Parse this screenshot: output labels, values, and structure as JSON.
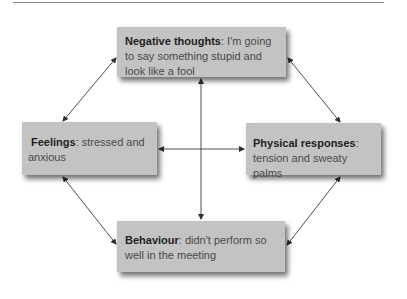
{
  "diagram": {
    "type": "cycle-diagram",
    "nodes": {
      "negative_thoughts": {
        "label": "Negative thoughts",
        "separator": ":",
        "text": " I'm going to say something stupid and look like a fool",
        "position": "top"
      },
      "feelings": {
        "label": "Feelings",
        "separator": ":",
        "text": " stressed and anxious",
        "position": "left"
      },
      "physical_responses": {
        "label": "Physical responses",
        "separator": ":",
        "text": " tension and sweaty palms",
        "position": "right"
      },
      "behaviour": {
        "label": "Behaviour",
        "separator": ":",
        "text": " didn't perform so well in the meeting",
        "position": "bottom"
      }
    },
    "edges": [
      {
        "from": "negative_thoughts",
        "to": "feelings",
        "direction": "both"
      },
      {
        "from": "negative_thoughts",
        "to": "physical_responses",
        "direction": "both"
      },
      {
        "from": "negative_thoughts",
        "to": "behaviour",
        "direction": "both"
      },
      {
        "from": "feelings",
        "to": "physical_responses",
        "direction": "both"
      },
      {
        "from": "feelings",
        "to": "behaviour",
        "direction": "both"
      },
      {
        "from": "physical_responses",
        "to": "behaviour",
        "direction": "both"
      }
    ],
    "colors": {
      "box_fill": "#c3c3c3",
      "label_text": "#1e1e1e",
      "body_text": "#4a4a4a",
      "arrow": "#3a3a3a",
      "rule": "#8a8a8a"
    }
  }
}
